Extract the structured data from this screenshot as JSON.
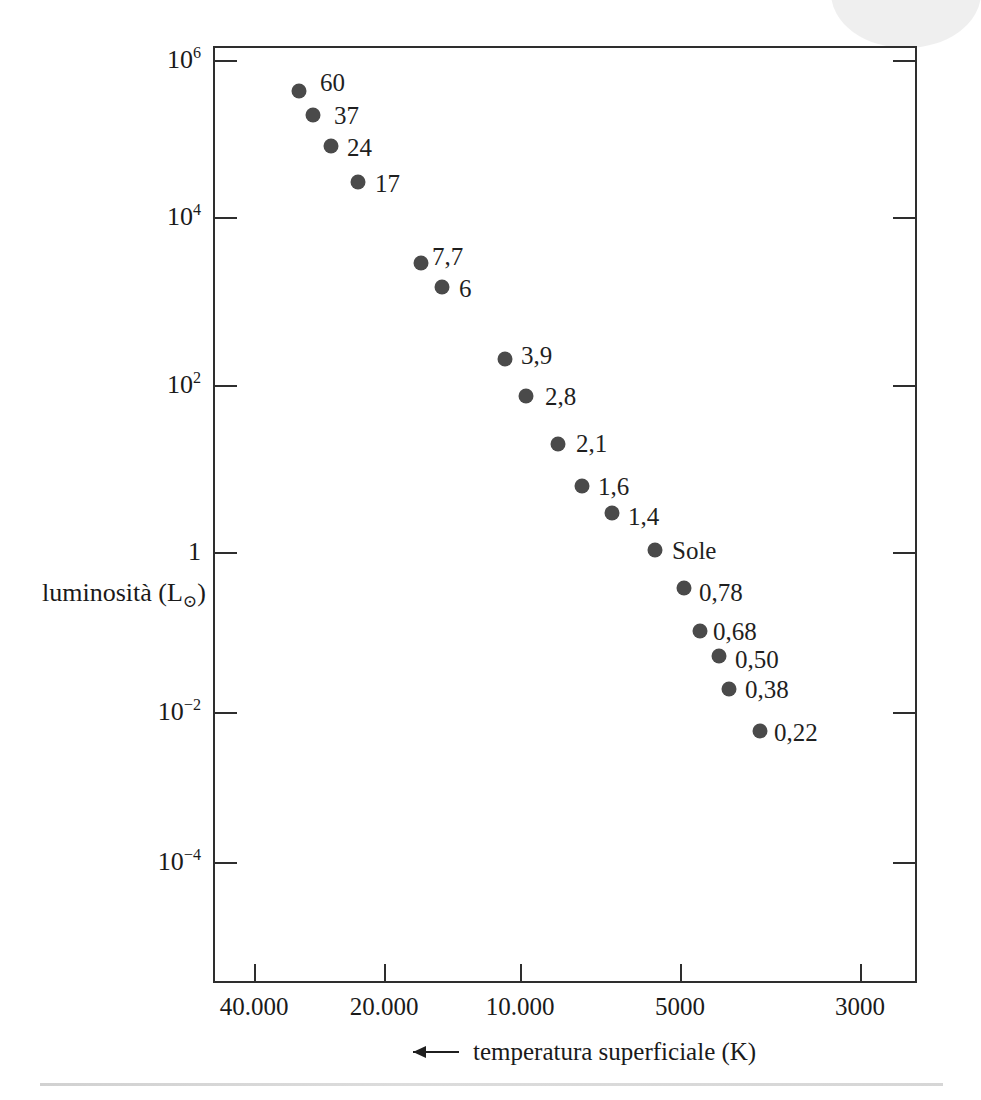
{
  "chart_data": {
    "type": "scatter",
    "title": "",
    "xlabel": "temperatura superficiale (K)",
    "ylabel": "luminosità (L⊙)",
    "x_axis": {
      "label": "temperatura superficiale (K)",
      "arrow_icon": "left-arrow-icon",
      "scale": "log-reversed",
      "tick_labels": [
        "40.000",
        "20.000",
        "10.000",
        "5000",
        "3000"
      ],
      "tick_values": [
        40000,
        20000,
        10000,
        5000,
        3000
      ],
      "tick_px": [
        252,
        382,
        518,
        678,
        858
      ]
    },
    "y_axis": {
      "label_text": "luminosità (L",
      "label_sun_symbol": "⊙",
      "label_close": ")",
      "scale": "log",
      "tick_labels": [
        "10^6",
        "10^4",
        "10^2",
        "1",
        "10^-2",
        "10^-4"
      ],
      "tick_mantissas": [
        "10",
        "10",
        "10",
        "1",
        "10",
        "10"
      ],
      "tick_exponents": [
        "6",
        "4",
        "2",
        "",
        "-2",
        "-4"
      ],
      "tick_values": [
        1000000,
        10000,
        100,
        1,
        0.01,
        0.0001
      ],
      "tick_px": [
        58,
        215,
        383,
        550,
        710,
        860
      ]
    },
    "grid": false,
    "legend": false,
    "points": [
      {
        "label": "60",
        "mass": 60,
        "temperature_k": 44500,
        "luminosity_lsun": 400000,
        "x_px": 297,
        "y_px": 89,
        "label_x_px": 318,
        "label_y_px": 80
      },
      {
        "label": "37",
        "mass": 37,
        "temperature_k": 38500,
        "luminosity_lsun": 200000,
        "x_px": 311,
        "y_px": 113,
        "label_x_px": 332,
        "label_y_px": 113
      },
      {
        "label": "24",
        "mass": 24,
        "temperature_k": 33000,
        "luminosity_lsun": 80000,
        "x_px": 329,
        "y_px": 144,
        "label_x_px": 345,
        "label_y_px": 145
      },
      {
        "label": "17",
        "mass": 17,
        "temperature_k": 27000,
        "luminosity_lsun": 30000,
        "x_px": 356,
        "y_px": 180,
        "label_x_px": 373,
        "label_y_px": 181
      },
      {
        "label": "7,7",
        "mass": 7.7,
        "temperature_k": 16000,
        "luminosity_lsun": 2500,
        "x_px": 419,
        "y_px": 261,
        "label_x_px": 430,
        "label_y_px": 254
      },
      {
        "label": "6",
        "mass": 6,
        "temperature_k": 14500,
        "luminosity_lsun": 1500,
        "x_px": 440,
        "y_px": 285,
        "label_x_px": 457,
        "label_y_px": 286
      },
      {
        "label": "3,9",
        "mass": 3.9,
        "temperature_k": 10500,
        "luminosity_lsun": 200,
        "x_px": 503,
        "y_px": 357,
        "label_x_px": 519,
        "label_y_px": 353
      },
      {
        "label": "2,8",
        "mass": 2.8,
        "temperature_k": 9500,
        "luminosity_lsun": 80,
        "x_px": 524,
        "y_px": 394,
        "label_x_px": 543,
        "label_y_px": 394
      },
      {
        "label": "2,1",
        "mass": 2.1,
        "temperature_k": 8000,
        "luminosity_lsun": 21,
        "x_px": 556,
        "y_px": 442,
        "label_x_px": 574,
        "label_y_px": 441
      },
      {
        "label": "1,6",
        "mass": 1.6,
        "temperature_k": 7000,
        "luminosity_lsun": 6.5,
        "x_px": 580,
        "y_px": 484,
        "label_x_px": 596,
        "label_y_px": 484
      },
      {
        "label": "1,4",
        "mass": 1.4,
        "temperature_k": 6500,
        "luminosity_lsun": 3.2,
        "x_px": 610,
        "y_px": 511,
        "label_x_px": 626,
        "label_y_px": 514
      },
      {
        "label": "Sole",
        "mass": 1,
        "temperature_k": 5800,
        "luminosity_lsun": 1,
        "x_px": 653,
        "y_px": 548,
        "label_x_px": 670,
        "label_y_px": 548
      },
      {
        "label": "0,78",
        "mass": 0.78,
        "temperature_k": 5200,
        "luminosity_lsun": 0.42,
        "x_px": 682,
        "y_px": 586,
        "label_x_px": 697,
        "label_y_px": 590
      },
      {
        "label": "0,68",
        "mass": 0.68,
        "temperature_k": 4900,
        "luminosity_lsun": 0.2,
        "x_px": 698,
        "y_px": 629,
        "label_x_px": 711,
        "label_y_px": 629
      },
      {
        "label": "0,50",
        "mass": 0.5,
        "temperature_k": 4600,
        "luminosity_lsun": 0.12,
        "x_px": 717,
        "y_px": 654,
        "label_x_px": 733,
        "label_y_px": 657
      },
      {
        "label": "0,38",
        "mass": 0.38,
        "temperature_k": 4300,
        "luminosity_lsun": 0.05,
        "x_px": 727,
        "y_px": 687,
        "label_x_px": 743,
        "label_y_px": 687
      },
      {
        "label": "0,22",
        "mass": 0.22,
        "temperature_k": 3600,
        "luminosity_lsun": 0.006,
        "x_px": 758,
        "y_px": 729,
        "label_x_px": 772,
        "label_y_px": 730
      }
    ]
  },
  "colors": {
    "point": "#4a4a4a",
    "axis": "#2e2e2e",
    "text": "#1a1a1a",
    "background": "#ffffff"
  }
}
